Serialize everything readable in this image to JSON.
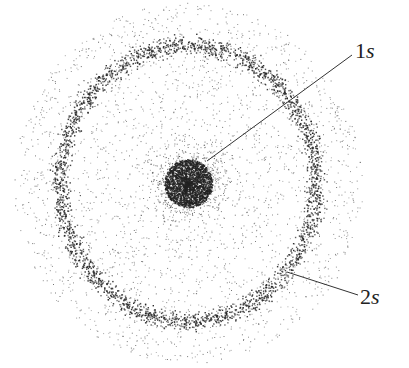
{
  "diagram": {
    "title": "",
    "labels": [
      {
        "id": "1s",
        "num": "1",
        "sub": "s"
      },
      {
        "id": "2s",
        "num": "2",
        "sub": "s"
      }
    ],
    "center": {
      "x": 188,
      "y": 183
    },
    "core_radius": 24,
    "ring": {
      "rx": 128,
      "ry": 138
    },
    "colors": {
      "dots": "#222222",
      "background": "#ffffff"
    }
  }
}
